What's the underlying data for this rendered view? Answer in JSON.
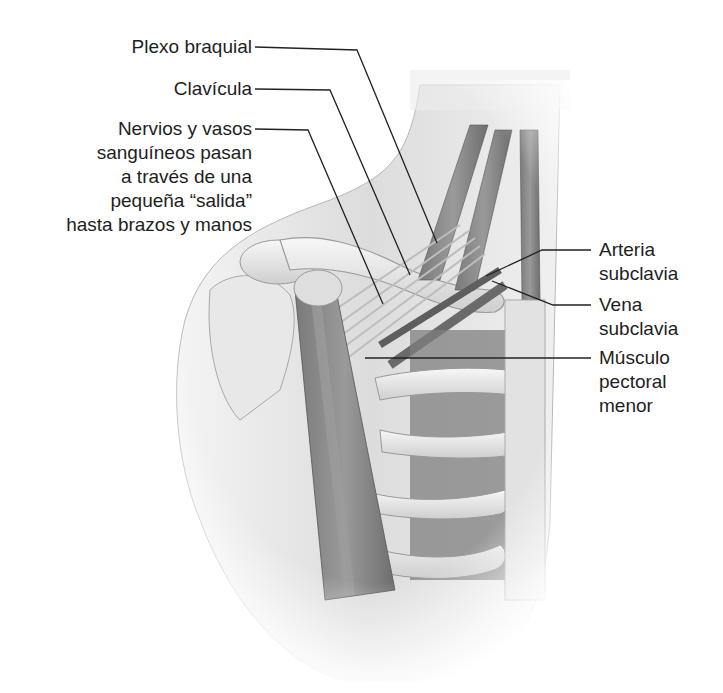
{
  "figure": {
    "colors": {
      "background": "#ffffff",
      "skin": "#e4e4e4",
      "bone": "#efefef",
      "muscle": "#8a8a8a",
      "muscle_dark": "#6b6b6b",
      "leader_line": "#222222",
      "text": "#1e1e1e"
    }
  },
  "labels": {
    "plexo_braquial": "Plexo braquial",
    "clavicula": "Clavícula",
    "nervios_vasos": "Nervios y vasos\nsanguíneos pasan\na través de una\npequeña “salida”\nhasta brazos y manos",
    "arteria_subclavia": "Arteria\nsubclavia",
    "vena_subclavia": "Vena\nsubclavia",
    "musculo_pectoral_menor": "Músculo\npectoral\nmenor"
  }
}
